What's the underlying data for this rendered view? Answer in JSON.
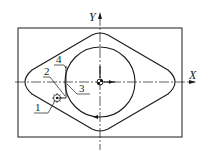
{
  "figure": {
    "axes": {
      "x_label": "X",
      "y_label": "Y"
    },
    "labels": [
      {
        "id": "1",
        "text": "1",
        "refers_to": "cutter"
      },
      {
        "id": "2",
        "text": "2",
        "refers_to": "approach-point"
      },
      {
        "id": "3",
        "text": "3",
        "refers_to": "cut-in-point"
      },
      {
        "id": "4",
        "text": "4",
        "refers_to": "tangent-entry-path"
      }
    ],
    "colors": {
      "line": "#1a1a1a",
      "background": "#ffffff"
    }
  }
}
